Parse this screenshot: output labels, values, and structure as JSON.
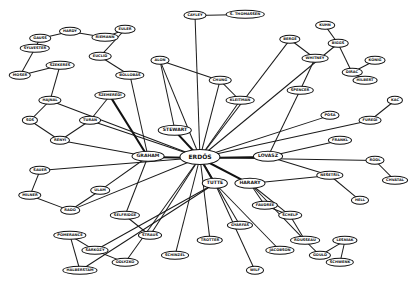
{
  "nodes": [
    {
      "id": "erdos",
      "label": "ERDŐS",
      "x": 200,
      "y": 157,
      "type": "hub"
    },
    {
      "id": "graham",
      "label": "GRAHAM",
      "x": 148,
      "y": 156,
      "type": "mid"
    },
    {
      "id": "tutte",
      "label": "TUTTE",
      "x": 215,
      "y": 183,
      "type": "mid"
    },
    {
      "id": "harary",
      "label": "HARARY",
      "x": 250,
      "y": 183,
      "type": "mid"
    },
    {
      "id": "lovasz",
      "label": "LOVÁSZ",
      "x": 268,
      "y": 156,
      "type": "mid"
    },
    {
      "id": "stewart",
      "label": "STEWART",
      "x": 175,
      "y": 130,
      "type": "mid"
    },
    {
      "id": "gauss",
      "label": "GAUSS",
      "x": 40,
      "y": 38
    },
    {
      "id": "n1",
      "label": "HARDY",
      "x": 70,
      "y": 31
    },
    {
      "id": "n2",
      "label": "EULER",
      "x": 125,
      "y": 29
    },
    {
      "id": "n3",
      "label": "RIEMANN",
      "x": 105,
      "y": 37
    },
    {
      "id": "n4",
      "label": "CAYLEY",
      "x": 195,
      "y": 15
    },
    {
      "id": "n5",
      "label": "S. THOMASSEN",
      "x": 245,
      "y": 14
    },
    {
      "id": "n6",
      "label": "SYLVESTER",
      "x": 35,
      "y": 48
    },
    {
      "id": "n7",
      "label": "EUCLID",
      "x": 100,
      "y": 56
    },
    {
      "id": "n8",
      "label": "BERGE",
      "x": 290,
      "y": 39
    },
    {
      "id": "n9",
      "label": "BIGGS",
      "x": 338,
      "y": 43
    },
    {
      "id": "n10",
      "label": "KÖNIG",
      "x": 375,
      "y": 60
    },
    {
      "id": "n11",
      "label": "HILBERT",
      "x": 365,
      "y": 80
    },
    {
      "id": "n12",
      "label": "DIRAC",
      "x": 352,
      "y": 72
    },
    {
      "id": "n13",
      "label": "WHITNEY",
      "x": 315,
      "y": 58
    },
    {
      "id": "n14",
      "label": "KUHN",
      "x": 325,
      "y": 25
    },
    {
      "id": "n15",
      "label": "HAJNAL",
      "x": 50,
      "y": 100
    },
    {
      "id": "n16",
      "label": "SÓS",
      "x": 30,
      "y": 120
    },
    {
      "id": "n17",
      "label": "RÉNYI",
      "x": 60,
      "y": 140
    },
    {
      "id": "n18",
      "label": "TURÁN",
      "x": 90,
      "y": 120
    },
    {
      "id": "n19",
      "label": "SZEMERÉDI",
      "x": 110,
      "y": 95
    },
    {
      "id": "n20",
      "label": "BOLLOBÁS",
      "x": 130,
      "y": 75
    },
    {
      "id": "n21",
      "label": "ALON",
      "x": 160,
      "y": 60
    },
    {
      "id": "n22",
      "label": "KLEITMAN",
      "x": 240,
      "y": 100
    },
    {
      "id": "n23",
      "label": "CHUNG",
      "x": 220,
      "y": 80
    },
    {
      "id": "n24",
      "label": "SPENCER",
      "x": 300,
      "y": 90
    },
    {
      "id": "n25",
      "label": "PÓSA",
      "x": 330,
      "y": 115
    },
    {
      "id": "n26",
      "label": "FÜREDI",
      "x": 370,
      "y": 120
    },
    {
      "id": "n27",
      "label": "FRANKL",
      "x": 340,
      "y": 140
    },
    {
      "id": "n28",
      "label": "RÖDL",
      "x": 375,
      "y": 160
    },
    {
      "id": "n29",
      "label": "NEŠETŘIL",
      "x": 330,
      "y": 175
    },
    {
      "id": "n30",
      "label": "HELL",
      "x": 360,
      "y": 200
    },
    {
      "id": "n31",
      "label": "SAUER",
      "x": 40,
      "y": 170
    },
    {
      "id": "n32",
      "label": "MILNER",
      "x": 30,
      "y": 195
    },
    {
      "id": "n33",
      "label": "RADO",
      "x": 70,
      "y": 210
    },
    {
      "id": "n34",
      "label": "ULAM",
      "x": 100,
      "y": 190
    },
    {
      "id": "n35",
      "label": "SELFRIDGE",
      "x": 125,
      "y": 215
    },
    {
      "id": "n36",
      "label": "STRAUS",
      "x": 150,
      "y": 235
    },
    {
      "id": "n37",
      "label": "POMERANCE",
      "x": 70,
      "y": 235
    },
    {
      "id": "n38",
      "label": "SÁRKÖZY",
      "x": 95,
      "y": 250
    },
    {
      "id": "n39",
      "label": "ODLYZKO",
      "x": 125,
      "y": 262
    },
    {
      "id": "n40",
      "label": "HALBERSTAM",
      "x": 80,
      "y": 270
    },
    {
      "id": "n41",
      "label": "SCHINZEL",
      "x": 175,
      "y": 255
    },
    {
      "id": "n42",
      "label": "TROTTER",
      "x": 210,
      "y": 240
    },
    {
      "id": "n43",
      "label": "GYÁRFÁS",
      "x": 240,
      "y": 225
    },
    {
      "id": "n44",
      "label": "FAUDREE",
      "x": 265,
      "y": 205
    },
    {
      "id": "n45",
      "label": "SCHELP",
      "x": 290,
      "y": 215
    },
    {
      "id": "n46",
      "label": "ROUSSEAU",
      "x": 305,
      "y": 240
    },
    {
      "id": "n47",
      "label": "JACOBSON",
      "x": 280,
      "y": 250
    },
    {
      "id": "n48",
      "label": "GOULD",
      "x": 320,
      "y": 255
    },
    {
      "id": "n49",
      "label": "LESNIAK",
      "x": 345,
      "y": 240
    },
    {
      "id": "n50",
      "label": "SCHWENK",
      "x": 340,
      "y": 262
    },
    {
      "id": "n51",
      "label": "WILF",
      "x": 255,
      "y": 270
    },
    {
      "id": "n52",
      "label": "MOSER",
      "x": 20,
      "y": 75
    },
    {
      "id": "n53",
      "label": "SZEKERES",
      "x": 60,
      "y": 65
    },
    {
      "id": "n54",
      "label": "KAC",
      "x": 395,
      "y": 100
    },
    {
      "id": "n55",
      "label": "CHVÁTAL",
      "x": 395,
      "y": 180
    }
  ],
  "edges": [
    [
      "erdos",
      "graham",
      1
    ],
    [
      "erdos",
      "tutte",
      1
    ],
    [
      "erdos",
      "harary",
      1
    ],
    [
      "erdos",
      "lovasz",
      1
    ],
    [
      "erdos",
      "stewart",
      1
    ],
    [
      "graham",
      "n19",
      1
    ],
    [
      "graham",
      "n34",
      0
    ],
    [
      "graham",
      "n17",
      0
    ],
    [
      "graham",
      "n20",
      0
    ],
    [
      "graham",
      "n35",
      0
    ],
    [
      "harary",
      "n44",
      0
    ],
    [
      "harary",
      "n29",
      0
    ],
    [
      "harary",
      "n46",
      0
    ],
    [
      "lovasz",
      "n24",
      0
    ],
    [
      "lovasz",
      "n27",
      0
    ],
    [
      "erdos",
      "n22",
      0
    ],
    [
      "erdos",
      "n23",
      0
    ],
    [
      "erdos",
      "n21",
      0
    ],
    [
      "erdos",
      "n36",
      0
    ],
    [
      "erdos",
      "n41",
      0
    ],
    [
      "erdos",
      "n42",
      0
    ],
    [
      "erdos",
      "n43",
      0
    ],
    [
      "erdos",
      "n25",
      0
    ],
    [
      "erdos",
      "n26",
      0
    ],
    [
      "erdos",
      "n28",
      0
    ],
    [
      "erdos",
      "n15",
      0
    ],
    [
      "erdos",
      "n18",
      0
    ],
    [
      "erdos",
      "n31",
      0
    ],
    [
      "erdos",
      "n33",
      0
    ],
    [
      "erdos",
      "n39",
      0
    ],
    [
      "erdos",
      "n4",
      0
    ],
    [
      "erdos",
      "n8",
      0
    ],
    [
      "erdos",
      "n9",
      0
    ],
    [
      "tutte",
      "n51",
      0
    ],
    [
      "tutte",
      "n47",
      0
    ],
    [
      "tutte",
      "n38",
      0
    ],
    [
      "tutte",
      "n40",
      0
    ],
    [
      "gauss",
      "n1",
      0
    ],
    [
      "gauss",
      "n6",
      0
    ],
    [
      "n1",
      "n3",
      0
    ],
    [
      "n3",
      "n2",
      0
    ],
    [
      "n2",
      "n7",
      0
    ],
    [
      "n7",
      "n20",
      0
    ],
    [
      "n4",
      "n5",
      0
    ],
    [
      "n8",
      "n13",
      0
    ],
    [
      "n9",
      "n14",
      0
    ],
    [
      "n9",
      "n12",
      0
    ],
    [
      "n12",
      "n11",
      0
    ],
    [
      "n10",
      "n12",
      0
    ],
    [
      "n15",
      "n16",
      0
    ],
    [
      "n16",
      "n17",
      0
    ],
    [
      "n17",
      "n18",
      0
    ],
    [
      "n18",
      "n19",
      0
    ],
    [
      "n31",
      "n32",
      0
    ],
    [
      "n32",
      "n33",
      0
    ],
    [
      "n37",
      "n38",
      0
    ],
    [
      "n38",
      "n39",
      0
    ],
    [
      "n40",
      "n37",
      0
    ],
    [
      "n44",
      "n45",
      0
    ],
    [
      "n45",
      "n46",
      0
    ],
    [
      "n46",
      "n48",
      0
    ],
    [
      "n48",
      "n49",
      0
    ],
    [
      "n49",
      "n50",
      0
    ],
    [
      "n29",
      "n30",
      0
    ],
    [
      "n28",
      "n55",
      0
    ],
    [
      "n26",
      "n54",
      0
    ],
    [
      "n52",
      "n53",
      0
    ],
    [
      "n53",
      "n15",
      0
    ],
    [
      "n6",
      "n52",
      0
    ],
    [
      "n24",
      "n13",
      0
    ],
    [
      "n22",
      "n23",
      0
    ],
    [
      "n21",
      "n23",
      0
    ],
    [
      "stewart",
      "n21",
      0
    ],
    [
      "lovasz",
      "n29",
      0
    ],
    [
      "harary",
      "n45",
      0
    ],
    [
      "n35",
      "n36",
      0
    ],
    [
      "n34",
      "n33",
      0
    ]
  ]
}
